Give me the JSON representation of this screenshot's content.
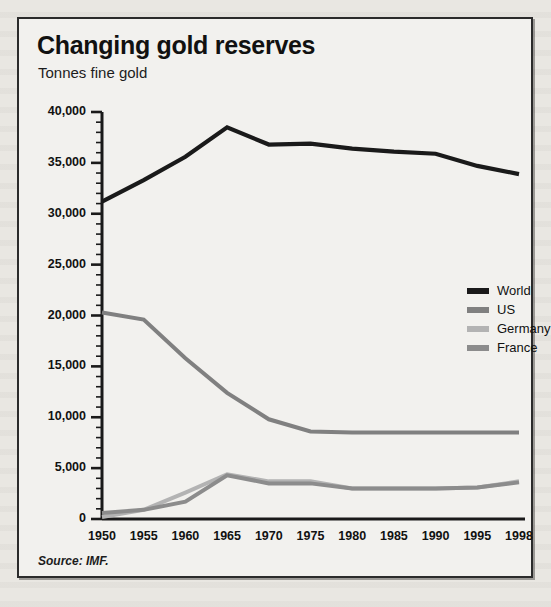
{
  "figure": {
    "title": "Changing gold reserves",
    "subtitle": "Tonnes fine gold",
    "source": "Source: IMF."
  },
  "chart_data": {
    "type": "line",
    "title": "Changing gold reserves",
    "subtitle": "Tonnes fine gold",
    "xlabel": "",
    "ylabel": "Tonnes fine gold",
    "ylim": [
      0,
      40000
    ],
    "ytick_labels": [
      "40,000",
      "35,000",
      "30,000",
      "25,000",
      "20,000",
      "15,000",
      "10,000",
      "5,000",
      "0"
    ],
    "ytick_values": [
      40000,
      35000,
      30000,
      25000,
      20000,
      15000,
      10000,
      5000,
      0
    ],
    "minor_tick_step": 1000,
    "grid": false,
    "legend_position": "inside-right",
    "categories": [
      "1950",
      "1955",
      "1960",
      "1965",
      "1970",
      "1975",
      "1980",
      "1985",
      "1990",
      "1995",
      "1998"
    ],
    "x": [
      1950,
      1955,
      1960,
      1965,
      1970,
      1975,
      1980,
      1985,
      1990,
      1995,
      1998
    ],
    "series": [
      {
        "name": "World",
        "color": "#1a1a1a",
        "values": [
          31200,
          33300,
          35600,
          38500,
          36800,
          36900,
          36400,
          36100,
          35900,
          34700,
          33900
        ]
      },
      {
        "name": "US",
        "color": "#808080",
        "values": [
          20300,
          19600,
          15800,
          12400,
          9800,
          8600,
          8500,
          8500,
          8500,
          8500,
          8500
        ]
      },
      {
        "name": "Germany",
        "color": "#b3b3b3",
        "values": [
          200,
          900,
          2600,
          4400,
          3700,
          3700,
          3000,
          3000,
          3000,
          3100,
          3700
        ]
      },
      {
        "name": "France",
        "color": "#8c8c8c",
        "values": [
          600,
          900,
          1700,
          4300,
          3500,
          3500,
          3000,
          3000,
          3000,
          3100,
          3600
        ]
      }
    ]
  },
  "legend": {
    "items": [
      {
        "label": "World",
        "color": "#1a1a1a"
      },
      {
        "label": "US",
        "color": "#808080"
      },
      {
        "label": "Germany",
        "color": "#b3b3b3"
      },
      {
        "label": "France",
        "color": "#8c8c8c"
      }
    ]
  }
}
